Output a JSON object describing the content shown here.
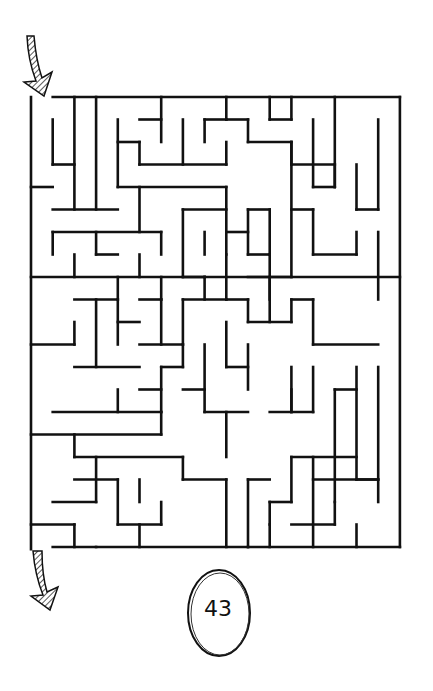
{
  "puzzle": {
    "type": "maze",
    "page_number": "43",
    "entrance_arrow": "entrance-arrow-icon",
    "exit_arrow": "exit-arrow-icon",
    "colors": {
      "wall": "#111111",
      "background": "#ffffff"
    },
    "grid": {
      "cols": 17,
      "rows": 20,
      "left": 31,
      "top": 97,
      "cell_w": 21.7,
      "cell_h": 22.5
    },
    "walls": [
      [
        0,
        0,
        0,
        20.1
      ],
      [
        1,
        0,
        17,
        0
      ],
      [
        17,
        0,
        17,
        20
      ],
      [
        1,
        20,
        17,
        20
      ],
      [
        1,
        1,
        1,
        3
      ],
      [
        1,
        3,
        2,
        3
      ],
      [
        2,
        0,
        2,
        5
      ],
      [
        3,
        0,
        3,
        5
      ],
      [
        0,
        4,
        1,
        4
      ],
      [
        1,
        5,
        4,
        5
      ],
      [
        4,
        1,
        4,
        4
      ],
      [
        4,
        2,
        5,
        2
      ],
      [
        5,
        2,
        5,
        3
      ],
      [
        5,
        3,
        9,
        3
      ],
      [
        6,
        0,
        6,
        2
      ],
      [
        5,
        1,
        6,
        1
      ],
      [
        7,
        1,
        7,
        3
      ],
      [
        8,
        1,
        8,
        2
      ],
      [
        8,
        1,
        9,
        1
      ],
      [
        4,
        4,
        9,
        4
      ],
      [
        5,
        4,
        5,
        6
      ],
      [
        1,
        6,
        6,
        6
      ],
      [
        1,
        6,
        1,
        7
      ],
      [
        3,
        6,
        3,
        7
      ],
      [
        3,
        7,
        4,
        7
      ],
      [
        2,
        7,
        2,
        8
      ],
      [
        5,
        7,
        5,
        8
      ],
      [
        6,
        6,
        6,
        7
      ],
      [
        0,
        8,
        17,
        8
      ],
      [
        4,
        8,
        4,
        9
      ],
      [
        6,
        8,
        6,
        9
      ],
      [
        7,
        5,
        9,
        5
      ],
      [
        7,
        5,
        7,
        8
      ],
      [
        8,
        6,
        8,
        7
      ],
      [
        9,
        0,
        9,
        1
      ],
      [
        9,
        1,
        10,
        1
      ],
      [
        10,
        1,
        10,
        2
      ],
      [
        10,
        2,
        12,
        2
      ],
      [
        9,
        2,
        9,
        3
      ],
      [
        11,
        0,
        11,
        1
      ],
      [
        11,
        1,
        12,
        1
      ],
      [
        12,
        2,
        12,
        3
      ],
      [
        12,
        3,
        14,
        3
      ],
      [
        12,
        1,
        12,
        0
      ],
      [
        13,
        1,
        13,
        4
      ],
      [
        13,
        4,
        14,
        4
      ],
      [
        14,
        4,
        14,
        3
      ],
      [
        14,
        0,
        14,
        4
      ],
      [
        12,
        2,
        12,
        8
      ],
      [
        12,
        5,
        13,
        5
      ],
      [
        13,
        5,
        13,
        7
      ],
      [
        13,
        7,
        15,
        7
      ],
      [
        15,
        6,
        15,
        7
      ],
      [
        15,
        3,
        15,
        5
      ],
      [
        15,
        5,
        16,
        5
      ],
      [
        16,
        1,
        16,
        5
      ],
      [
        16,
        6,
        16,
        9
      ],
      [
        10,
        5,
        10,
        7
      ],
      [
        10,
        5,
        11,
        5
      ],
      [
        11,
        5,
        11,
        7
      ],
      [
        10,
        7,
        11,
        7
      ],
      [
        9,
        6,
        10,
        6
      ],
      [
        9,
        4,
        9,
        7
      ],
      [
        9,
        7,
        9,
        9
      ],
      [
        11,
        7,
        11,
        10
      ],
      [
        10,
        8,
        12,
        8
      ],
      [
        11,
        8,
        11,
        9
      ],
      [
        2,
        9,
        4,
        9
      ],
      [
        3,
        9,
        3,
        12
      ],
      [
        4,
        9,
        4,
        11
      ],
      [
        4,
        10,
        5,
        10
      ],
      [
        2,
        10,
        2,
        11
      ],
      [
        0,
        11,
        2,
        11
      ],
      [
        2,
        12,
        5,
        12
      ],
      [
        5,
        9,
        6,
        9
      ],
      [
        6,
        9,
        6,
        11
      ],
      [
        5,
        11,
        7,
        11
      ],
      [
        7,
        9,
        7,
        11
      ],
      [
        7,
        9,
        9,
        9
      ],
      [
        8,
        9,
        8,
        8
      ],
      [
        7,
        8,
        8,
        8
      ],
      [
        8,
        8,
        8,
        8
      ],
      [
        9,
        9,
        10,
        9
      ],
      [
        10,
        9,
        10,
        10
      ],
      [
        10,
        10,
        12,
        10
      ],
      [
        12,
        9,
        12,
        10
      ],
      [
        12,
        9,
        13,
        9
      ],
      [
        13,
        9,
        13,
        11
      ],
      [
        13,
        11,
        16,
        11
      ],
      [
        6,
        12,
        7,
        12
      ],
      [
        6,
        12,
        6,
        14
      ],
      [
        7,
        12,
        7,
        11
      ],
      [
        8,
        11,
        8,
        14
      ],
      [
        9,
        10,
        9,
        12
      ],
      [
        9,
        12,
        10,
        12
      ],
      [
        10,
        11,
        10,
        13
      ],
      [
        12,
        12,
        12,
        14
      ],
      [
        7,
        13,
        8,
        13
      ],
      [
        5,
        13,
        6,
        13
      ],
      [
        4,
        13,
        4,
        14
      ],
      [
        1,
        14,
        6,
        14
      ],
      [
        6,
        14,
        6,
        15
      ],
      [
        0,
        15,
        6,
        15
      ],
      [
        2,
        15,
        2,
        16
      ],
      [
        8,
        14,
        10,
        14
      ],
      [
        9,
        14,
        9,
        16
      ],
      [
        11,
        14,
        13,
        14
      ],
      [
        12,
        13,
        12,
        14
      ],
      [
        13,
        12,
        13,
        14
      ],
      [
        14,
        13,
        14,
        18
      ],
      [
        14,
        13,
        15,
        13
      ],
      [
        15,
        12,
        15,
        17
      ],
      [
        16,
        12,
        16,
        18
      ],
      [
        15,
        17,
        16,
        17
      ],
      [
        2,
        16,
        7,
        16
      ],
      [
        7,
        16,
        7,
        17
      ],
      [
        7,
        17,
        9,
        17
      ],
      [
        9,
        17,
        9,
        20
      ],
      [
        3,
        16,
        3,
        18
      ],
      [
        2,
        17,
        4,
        17
      ],
      [
        4,
        17,
        4,
        19
      ],
      [
        4,
        19,
        6,
        19
      ],
      [
        6,
        18,
        6,
        19
      ],
      [
        5,
        17,
        5,
        18
      ],
      [
        1,
        18,
        3,
        18
      ],
      [
        0,
        19,
        2,
        19
      ],
      [
        2,
        19,
        2,
        20
      ],
      [
        3,
        20,
        3,
        20
      ],
      [
        5,
        19,
        5,
        20
      ],
      [
        10,
        17,
        10,
        20
      ],
      [
        10,
        17,
        11,
        17
      ],
      [
        12,
        16,
        12,
        18
      ],
      [
        12,
        16,
        15,
        16
      ],
      [
        11,
        18,
        12,
        18
      ],
      [
        11,
        18,
        11,
        19
      ],
      [
        10,
        20,
        10,
        20
      ],
      [
        13,
        16,
        13,
        20
      ],
      [
        13,
        17,
        16,
        17
      ],
      [
        15,
        19,
        15,
        20
      ],
      [
        12,
        19,
        14,
        19
      ],
      [
        14,
        18,
        14,
        19
      ],
      [
        11,
        20,
        11,
        19
      ]
    ]
  }
}
